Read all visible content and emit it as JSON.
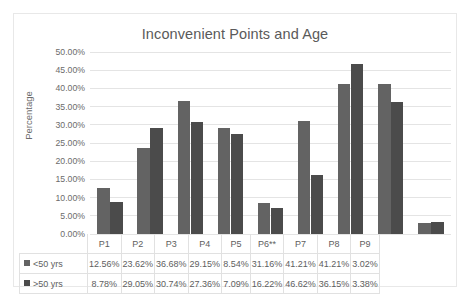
{
  "chart_data": {
    "type": "bar",
    "title": "Inconvenient Points and Age",
    "xlabel": "",
    "ylabel": "Percentage",
    "ylim": [
      0,
      50
    ],
    "grid": true,
    "legend_position": "data-table",
    "categories": [
      "P1",
      "P2",
      "P3",
      "P4",
      "P5",
      "P6**",
      "P7",
      "P8",
      "P9"
    ],
    "y_ticks": [
      "0.00%",
      "5.00%",
      "10.00%",
      "15.00%",
      "20.00%",
      "25.00%",
      "30.00%",
      "35.00%",
      "40.00%",
      "45.00%",
      "50.00%"
    ],
    "y_tick_values": [
      0,
      5,
      10,
      15,
      20,
      25,
      30,
      35,
      40,
      45,
      50
    ],
    "series": [
      {
        "name": "<50 yrs",
        "color": "#636363",
        "values": [
          12.56,
          23.62,
          36.68,
          29.15,
          8.54,
          31.16,
          41.21,
          41.21,
          3.02
        ],
        "labels": [
          "12.56%",
          "23.62%",
          "36.68%",
          "29.15%",
          "8.54%",
          "31.16%",
          "41.21%",
          "41.21%",
          "3.02%"
        ]
      },
      {
        "name": ">50 yrs",
        "color": "#4b4b4b",
        "values": [
          8.78,
          29.05,
          30.74,
          27.36,
          7.09,
          16.22,
          46.62,
          36.15,
          3.38
        ],
        "labels": [
          "8.78%",
          "29.05%",
          "30.74%",
          "27.36%",
          "7.09%",
          "16.22%",
          "46.62%",
          "36.15%",
          "3.38%"
        ]
      }
    ]
  }
}
